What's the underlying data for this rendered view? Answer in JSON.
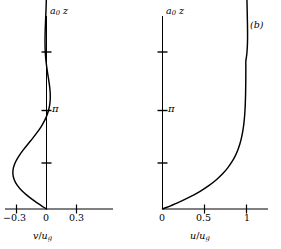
{
  "figure": {
    "panel_tag": "(b)",
    "background": "#ffffff",
    "stroke": "#000000"
  },
  "panels": {
    "left": {
      "name": "hodograph",
      "yaxis_title_main": "a",
      "yaxis_title_sub": "0",
      "yaxis_title_var": "z",
      "xaxis_title_num": "v",
      "xaxis_title_den": "u",
      "xaxis_title_sub": "g",
      "xticks": [
        "−0.3",
        "0",
        "0.3"
      ],
      "ytick_pi": "π"
    },
    "right": {
      "name": "velocity-profile",
      "yaxis_title_main": "a",
      "yaxis_title_sub": "0",
      "yaxis_title_var": "z",
      "xaxis_title_num": "u",
      "xaxis_title_den": "u",
      "xaxis_title_sub": "g",
      "xticks": [
        "0",
        "0.5",
        "1"
      ],
      "ytick_pi": "π"
    }
  },
  "chart_data": [
    {
      "type": "line",
      "name": "ekman-hodograph",
      "title": "",
      "xlabel": "v/u_g",
      "ylabel": "a_0 z",
      "xlim": [
        -0.45,
        0.45
      ],
      "ylim": [
        0,
        9.42
      ],
      "xticks": [
        -0.3,
        0,
        0.3
      ],
      "yticks": [
        3.1416,
        6.2832
      ],
      "ytick_labels": [
        "π",
        ""
      ],
      "grid": false,
      "legend": null,
      "description": "Ekman spiral hodograph: v/u_g plotted against non-dimensional height a_0 z; a large teardrop loop from z=0 to z=pi and a narrow decaying spiral above pi.",
      "x": [
        0.0,
        -0.0905,
        -0.1724,
        -0.2407,
        -0.2919,
        -0.3238,
        -0.3363,
        -0.3304,
        -0.3087,
        -0.2747,
        -0.2322,
        -0.1851,
        -0.1372,
        -0.0918,
        -0.0515,
        -0.0182,
        0.0074,
        0.0249,
        0.0347,
        0.0378,
        0.0354,
        0.0291,
        0.0205,
        0.0112,
        0.0025,
        -0.0048,
        -0.0101,
        -0.0134,
        -0.0148,
        -0.0146,
        -0.0133,
        -0.0113,
        -0.0089,
        -0.0065,
        -0.0042,
        -0.0023,
        -0.0007,
        0.0004,
        0.0012,
        0.0016,
        0.0017,
        0.0016,
        0.0014,
        0.0011,
        0.0008,
        0.0005,
        0.0002,
        0.0,
        -0.0001,
        -0.0002,
        -0.0002
      ],
      "y": [
        0.0,
        0.1885,
        0.377,
        0.5655,
        0.754,
        0.9425,
        1.131,
        1.3195,
        1.508,
        1.6965,
        1.885,
        2.0735,
        2.2619,
        2.4504,
        2.6389,
        2.8274,
        3.0159,
        3.2044,
        3.3929,
        3.5814,
        3.7699,
        3.9584,
        4.1469,
        4.3354,
        4.5239,
        4.7124,
        4.9009,
        5.0894,
        5.2779,
        5.4664,
        5.6549,
        5.8434,
        6.0319,
        6.2204,
        6.4088,
        6.5973,
        6.7858,
        6.9743,
        7.1628,
        7.3513,
        7.5398,
        7.7283,
        7.9168,
        8.1053,
        8.2938,
        8.4823,
        8.6708,
        8.8593,
        9.0478,
        9.2363,
        9.4248
      ]
    },
    {
      "type": "line",
      "name": "ekman-u-profile",
      "title": "",
      "xlabel": "u/u_g",
      "ylabel": "a_0 z",
      "xlim": [
        0,
        1.25
      ],
      "ylim": [
        0,
        9.42
      ],
      "xticks": [
        0,
        0.5,
        1
      ],
      "yticks": [
        3.1416,
        6.2832
      ],
      "ytick_labels": [
        "π",
        ""
      ],
      "grid": false,
      "legend": null,
      "description": "Ekman layer downwind velocity u/u_g versus non-dimensional height a_0 z; rises from 0 at the surface, overshoots slightly above 1 near a_0 z = 4, then relaxes toward 1.",
      "x": [
        0.0,
        0.1723,
        0.3205,
        0.448,
        0.5553,
        0.6448,
        0.7185,
        0.7787,
        0.8273,
        0.8661,
        0.8968,
        0.9208,
        0.9394,
        0.9537,
        0.9645,
        0.9726,
        0.9786,
        0.983,
        0.9861,
        0.9883,
        0.9898,
        0.9908,
        0.9915,
        0.9919,
        0.9921,
        0.9922,
        1.0019,
        1.008,
        1.0113,
        1.0126,
        1.0126,
        1.0118,
        1.0105,
        1.009,
        1.0075,
        1.006,
        1.0047,
        1.0036,
        1.0026,
        1.0019,
        1.0013,
        1.0008,
        1.0005,
        1.0002,
        1.0001,
        1.0,
        0.9999,
        0.9999,
        0.9999,
        0.9999,
        1.0
      ],
      "y": [
        0.0,
        0.1885,
        0.377,
        0.5655,
        0.754,
        0.9425,
        1.131,
        1.3195,
        1.508,
        1.6965,
        1.885,
        2.0735,
        2.2619,
        2.4504,
        2.6389,
        2.8274,
        3.0159,
        3.2044,
        3.3929,
        3.5814,
        3.7699,
        3.9584,
        4.1469,
        4.3354,
        4.5239,
        4.7124,
        4.9009,
        5.0894,
        5.2779,
        5.4664,
        5.6549,
        5.8434,
        6.0319,
        6.2204,
        6.4088,
        6.5973,
        6.7858,
        6.9743,
        7.1628,
        7.3513,
        7.5398,
        7.7283,
        7.9168,
        8.1053,
        8.2938,
        8.4823,
        8.6708,
        8.8593,
        9.0478,
        9.2363,
        9.4248
      ]
    }
  ]
}
